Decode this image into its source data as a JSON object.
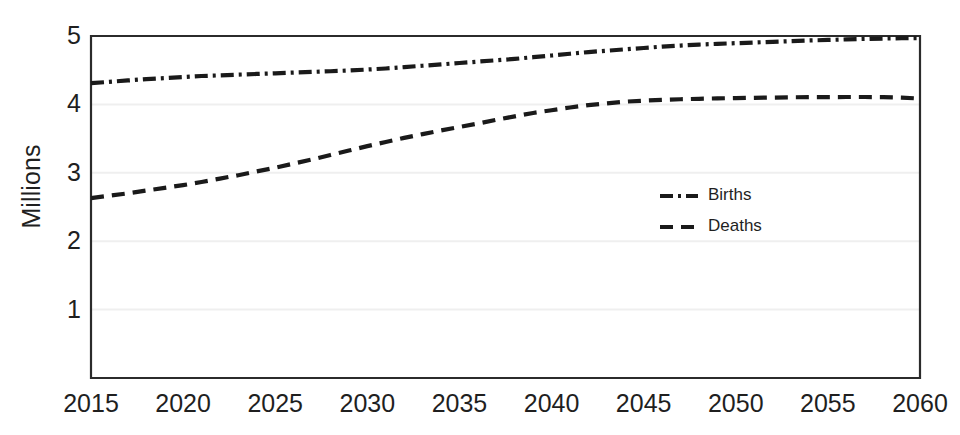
{
  "chart_data": {
    "type": "line",
    "title": "",
    "xlabel": "",
    "ylabel": "Millions",
    "xlim": [
      2015,
      2060
    ],
    "ylim": [
      0,
      5
    ],
    "grid": true,
    "legend_position": "center-right",
    "x_ticks": [
      "2015",
      "2020",
      "2025",
      "2030",
      "2035",
      "2040",
      "2045",
      "2050",
      "2055",
      "2060"
    ],
    "y_ticks": [
      "1",
      "2",
      "3",
      "4",
      "5"
    ],
    "x": [
      2015,
      2016,
      2017,
      2018,
      2019,
      2020,
      2021,
      2022,
      2023,
      2024,
      2025,
      2026,
      2027,
      2028,
      2029,
      2030,
      2031,
      2032,
      2033,
      2034,
      2035,
      2036,
      2037,
      2038,
      2039,
      2040,
      2041,
      2042,
      2043,
      2044,
      2045,
      2046,
      2047,
      2048,
      2049,
      2050,
      2051,
      2052,
      2053,
      2054,
      2055,
      2056,
      2057,
      2058,
      2059,
      2060
    ],
    "series": [
      {
        "name": "Births",
        "line_style": "dash-dot",
        "color": "#1a1a1a",
        "values": [
          4.31,
          4.33,
          4.35,
          4.37,
          4.385,
          4.4,
          4.415,
          4.425,
          4.435,
          4.445,
          4.455,
          4.465,
          4.475,
          4.485,
          4.495,
          4.51,
          4.525,
          4.545,
          4.565,
          4.585,
          4.605,
          4.625,
          4.645,
          4.665,
          4.69,
          4.715,
          4.74,
          4.765,
          4.785,
          4.805,
          4.825,
          4.845,
          4.86,
          4.875,
          4.885,
          4.895,
          4.905,
          4.915,
          4.925,
          4.935,
          4.942,
          4.95,
          4.957,
          4.963,
          4.968,
          4.97
        ]
      },
      {
        "name": "Deaths",
        "line_style": "dashed",
        "color": "#1a1a1a",
        "values": [
          2.63,
          2.665,
          2.7,
          2.74,
          2.78,
          2.82,
          2.865,
          2.915,
          2.965,
          3.02,
          3.075,
          3.135,
          3.195,
          3.26,
          3.325,
          3.39,
          3.45,
          3.51,
          3.565,
          3.62,
          3.67,
          3.72,
          3.775,
          3.825,
          3.875,
          3.915,
          3.955,
          3.99,
          4.015,
          4.04,
          4.055,
          4.065,
          4.075,
          4.082,
          4.088,
          4.092,
          4.096,
          4.1,
          4.104,
          4.106,
          4.107,
          4.108,
          4.108,
          4.107,
          4.1,
          4.085
        ]
      }
    ]
  },
  "legend": {
    "items": [
      {
        "label": "Births",
        "style": "dash-dot"
      },
      {
        "label": "Deaths",
        "style": "dashed"
      }
    ]
  },
  "colors": {
    "line": "#1a1a1a",
    "axis": "#2b2b2b",
    "gridline": "#efefef",
    "background": "#ffffff",
    "text": "#1f1f1f"
  }
}
